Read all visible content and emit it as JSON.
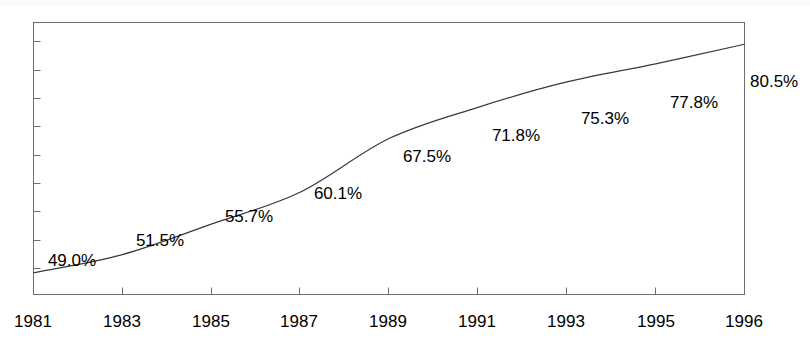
{
  "chart_data": {
    "type": "line",
    "title": "",
    "subtitle": "",
    "xlabel": "",
    "ylabel": "",
    "grid": false,
    "legend": false,
    "legend_position": "none",
    "categories": [
      "1981",
      "1983",
      "1985",
      "1987",
      "1989",
      "1991",
      "1993",
      "1995",
      "1996"
    ],
    "x_tick_labels": [
      "1981",
      "1983",
      "1985",
      "1987",
      "1989",
      "1991",
      "1993",
      "1995",
      "1996"
    ],
    "y_tick_labels": [],
    "ylim": [
      46.0,
      83.5
    ],
    "xlim": [
      1981,
      1996
    ],
    "point_label_suffix": "%",
    "series": [
      {
        "name": "",
        "color": "#3a3a3a",
        "x": [
          1981,
          1983,
          1985,
          1987,
          1989,
          1991,
          1993,
          1995,
          1996
        ],
        "values": [
          49.0,
          51.5,
          55.7,
          60.1,
          67.5,
          71.8,
          75.3,
          77.8,
          80.5
        ],
        "labels": [
          "49.0%",
          "51.5%",
          "55.7%",
          "60.1%",
          "67.5%",
          "71.8%",
          "75.3%",
          "77.8%",
          "80.5%"
        ]
      }
    ]
  },
  "axis": {
    "frame_color": "#6d6d6d",
    "tick_color": "#6d6d6d",
    "y_tick_count": 9
  },
  "labels": {
    "p1981": "49.0%",
    "p1983": "51.5%",
    "p1985": "55.7%",
    "p1987": "60.1%",
    "p1989": "67.5%",
    "p1991": "71.8%",
    "p1993": "75.3%",
    "p1995": "77.8%",
    "p1996": "80.5%",
    "x1981": "1981",
    "x1983": "1983",
    "x1985": "1985",
    "x1987": "1987",
    "x1989": "1989",
    "x1991": "1991",
    "x1993": "1993",
    "x1995": "1995",
    "x1996": "1996"
  }
}
